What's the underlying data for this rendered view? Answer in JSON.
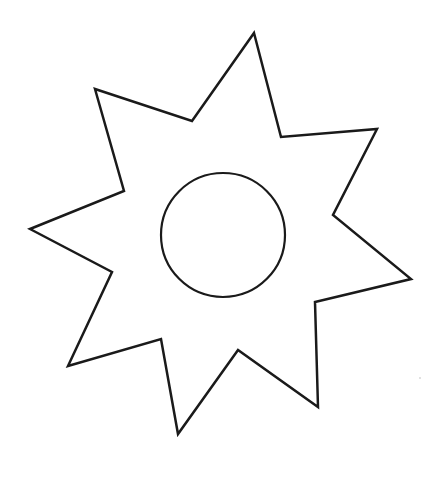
{
  "figure": {
    "background": "#ffffff",
    "stroke_color": "#1a1a1a",
    "stroke_width": 2.5,
    "star": {
      "points": "254,33 281,137 377,129 333,215 411,279 315,302 318,407 238,350 178,434 161,339 68,366 112,272 30,229 124,191 95,89 192,121"
    },
    "circle": {
      "cx": 223,
      "cy": 235,
      "r": 62
    },
    "speck": {
      "cx": 420,
      "cy": 378,
      "r": 0.8,
      "color": "#bbbbbb"
    }
  }
}
